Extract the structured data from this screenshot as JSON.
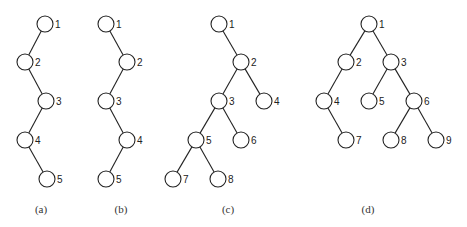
{
  "figure": {
    "node_radius": 8,
    "colors": {
      "stroke": "#222222",
      "fill": "#ffffff",
      "text": "#222222"
    },
    "trees": [
      {
        "caption": "(a)",
        "caption_pos": [
          41,
          213
        ],
        "nodes": [
          {
            "label": "1",
            "x": 45,
            "y": 24
          },
          {
            "label": "2",
            "x": 25,
            "y": 62
          },
          {
            "label": "3",
            "x": 46,
            "y": 101
          },
          {
            "label": "4",
            "x": 25,
            "y": 140
          },
          {
            "label": "5",
            "x": 47,
            "y": 179
          }
        ],
        "edges": [
          [
            "1",
            "2"
          ],
          [
            "2",
            "3"
          ],
          [
            "3",
            "4"
          ],
          [
            "4",
            "5"
          ]
        ]
      },
      {
        "caption": "(b)",
        "caption_pos": [
          121,
          213
        ],
        "nodes": [
          {
            "label": "1",
            "x": 106,
            "y": 24
          },
          {
            "label": "2",
            "x": 127,
            "y": 62
          },
          {
            "label": "3",
            "x": 106,
            "y": 101
          },
          {
            "label": "4",
            "x": 127,
            "y": 140
          },
          {
            "label": "5",
            "x": 106,
            "y": 179
          }
        ],
        "edges": [
          [
            "1",
            "2"
          ],
          [
            "2",
            "3"
          ],
          [
            "3",
            "4"
          ],
          [
            "4",
            "5"
          ]
        ]
      },
      {
        "caption": "(c)",
        "caption_pos": [
          228,
          213
        ],
        "nodes": [
          {
            "label": "1",
            "x": 219,
            "y": 24
          },
          {
            "label": "2",
            "x": 241,
            "y": 62
          },
          {
            "label": "3",
            "x": 219,
            "y": 101
          },
          {
            "label": "4",
            "x": 264,
            "y": 101
          },
          {
            "label": "5",
            "x": 196,
            "y": 140
          },
          {
            "label": "6",
            "x": 241,
            "y": 140
          },
          {
            "label": "7",
            "x": 173,
            "y": 179
          },
          {
            "label": "8",
            "x": 218,
            "y": 179
          }
        ],
        "edges": [
          [
            "1",
            "2"
          ],
          [
            "2",
            "3"
          ],
          [
            "2",
            "4"
          ],
          [
            "3",
            "5"
          ],
          [
            "3",
            "6"
          ],
          [
            "5",
            "7"
          ],
          [
            "5",
            "8"
          ]
        ]
      },
      {
        "caption": "(d)",
        "caption_pos": [
          368,
          213
        ],
        "nodes": [
          {
            "label": "1",
            "x": 369,
            "y": 24
          },
          {
            "label": "2",
            "x": 346,
            "y": 62
          },
          {
            "label": "3",
            "x": 391,
            "y": 62
          },
          {
            "label": "4",
            "x": 324,
            "y": 101
          },
          {
            "label": "5",
            "x": 369,
            "y": 101
          },
          {
            "label": "6",
            "x": 414,
            "y": 101
          },
          {
            "label": "7",
            "x": 346,
            "y": 140
          },
          {
            "label": "8",
            "x": 391,
            "y": 140
          },
          {
            "label": "9",
            "x": 436,
            "y": 140
          }
        ],
        "edges": [
          [
            "1",
            "2"
          ],
          [
            "1",
            "3"
          ],
          [
            "2",
            "4"
          ],
          [
            "3",
            "5"
          ],
          [
            "3",
            "6"
          ],
          [
            "4",
            "7"
          ],
          [
            "6",
            "8"
          ],
          [
            "6",
            "9"
          ]
        ]
      }
    ]
  }
}
